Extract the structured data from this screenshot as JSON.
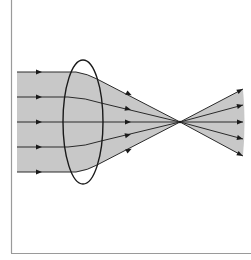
{
  "diagram": {
    "colors": {
      "background": "#ffffff",
      "frame": "#9a9a9a",
      "beam_fill": "#c8c8c8",
      "ray": "#2a2a2a",
      "lens": "#1a1a1a"
    },
    "lens": {
      "shape": "biconvex",
      "cx": 83,
      "cy": 122,
      "rx": 20,
      "ry": 62
    },
    "focal_point": {
      "x": 180,
      "y": 122
    },
    "incoming_rays_y": [
      72,
      97,
      122,
      147,
      172
    ],
    "ray_count": 5,
    "labels": []
  }
}
